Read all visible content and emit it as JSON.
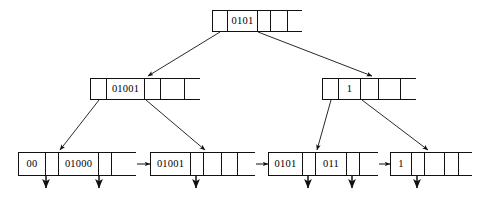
{
  "diagram": {
    "type": "b-plus-tree",
    "stroke_color": "#111111",
    "background_color": "#ffffff",
    "fanout": 5
  },
  "nodes": {
    "root": {
      "name": "root-node",
      "x": 212,
      "y": 10,
      "w": 90,
      "h": 22,
      "cells": [
        {
          "kind": "pointer",
          "label": "",
          "w": 15
        },
        {
          "kind": "key",
          "label": "0101",
          "w": 30
        },
        {
          "kind": "pointer",
          "label": "",
          "w": 13
        },
        {
          "kind": "empty",
          "label": "",
          "w": 17
        },
        {
          "kind": "empty",
          "label": "",
          "w": 15
        }
      ]
    },
    "internal_left": {
      "name": "internal-node-left",
      "x": 90,
      "y": 78,
      "w": 110,
      "h": 22,
      "cells": [
        {
          "kind": "pointer",
          "label": "",
          "w": 16
        },
        {
          "kind": "key",
          "label": "01001",
          "w": 38
        },
        {
          "kind": "pointer",
          "label": "",
          "w": 16
        },
        {
          "kind": "empty",
          "label": "",
          "w": 24
        },
        {
          "kind": "empty",
          "label": "",
          "w": 16
        }
      ]
    },
    "internal_right": {
      "name": "internal-node-right",
      "x": 322,
      "y": 78,
      "w": 94,
      "h": 22,
      "cells": [
        {
          "kind": "pointer",
          "label": "",
          "w": 16
        },
        {
          "kind": "key",
          "label": "1",
          "w": 22
        },
        {
          "kind": "pointer",
          "label": "",
          "w": 18
        },
        {
          "kind": "empty",
          "label": "",
          "w": 22
        },
        {
          "kind": "empty",
          "label": "",
          "w": 16
        }
      ]
    },
    "leaf_1": {
      "name": "leaf-node-1",
      "x": 18,
      "y": 152,
      "w": 118,
      "h": 24,
      "cells": [
        {
          "kind": "key",
          "label": "00",
          "w": 27
        },
        {
          "kind": "pointer",
          "label": "",
          "w": 13
        },
        {
          "kind": "key",
          "label": "01000",
          "w": 40
        },
        {
          "kind": "pointer",
          "label": "",
          "w": 13
        },
        {
          "kind": "next",
          "label": "",
          "w": 25
        }
      ]
    },
    "leaf_2": {
      "name": "leaf-node-2",
      "x": 150,
      "y": 152,
      "w": 105,
      "h": 24,
      "cells": [
        {
          "kind": "key",
          "label": "01001",
          "w": 40
        },
        {
          "kind": "pointer",
          "label": "",
          "w": 13
        },
        {
          "kind": "empty",
          "label": "",
          "w": 18
        },
        {
          "kind": "empty",
          "label": "",
          "w": 16
        },
        {
          "kind": "next",
          "label": "",
          "w": 18
        }
      ]
    },
    "leaf_3": {
      "name": "leaf-node-3",
      "x": 268,
      "y": 152,
      "w": 110,
      "h": 24,
      "cells": [
        {
          "kind": "key",
          "label": "0101",
          "w": 34
        },
        {
          "kind": "pointer",
          "label": "",
          "w": 13
        },
        {
          "kind": "key",
          "label": "011",
          "w": 31
        },
        {
          "kind": "pointer",
          "label": "",
          "w": 13
        },
        {
          "kind": "next",
          "label": "",
          "w": 19
        }
      ]
    },
    "leaf_4": {
      "name": "leaf-node-4",
      "x": 390,
      "y": 152,
      "w": 82,
      "h": 24,
      "cells": [
        {
          "kind": "key",
          "label": "1",
          "w": 21
        },
        {
          "kind": "pointer",
          "label": "",
          "w": 13
        },
        {
          "kind": "empty",
          "label": "",
          "w": 20
        },
        {
          "kind": "empty",
          "label": "",
          "w": 14
        },
        {
          "kind": "empty",
          "label": "",
          "w": 14
        }
      ]
    }
  },
  "edges": [
    {
      "name": "edge-root-to-internal-left",
      "from": [
        220,
        32
      ],
      "to": [
        148,
        76
      ]
    },
    {
      "name": "edge-root-to-internal-right",
      "from": [
        258,
        32
      ],
      "to": [
        372,
        76
      ]
    },
    {
      "name": "edge-internal-left-to-leaf-1",
      "from": [
        99,
        100
      ],
      "to": [
        60,
        150
      ]
    },
    {
      "name": "edge-internal-left-to-leaf-2",
      "from": [
        146,
        100
      ],
      "to": [
        205,
        150
      ]
    },
    {
      "name": "edge-internal-right-to-leaf-3",
      "from": [
        331,
        100
      ],
      "to": [
        317,
        150
      ]
    },
    {
      "name": "edge-internal-right-to-leaf-4",
      "from": [
        362,
        100
      ],
      "to": [
        428,
        150
      ]
    }
  ],
  "record_arrows": [
    {
      "name": "record-arrow-leaf1-a",
      "x": 46,
      "y0": 168,
      "y1": 188
    },
    {
      "name": "record-arrow-leaf1-b",
      "x": 99,
      "y0": 168,
      "y1": 188
    },
    {
      "name": "record-arrow-leaf2-a",
      "x": 196,
      "y0": 168,
      "y1": 188
    },
    {
      "name": "record-arrow-leaf3-a",
      "x": 308,
      "y0": 168,
      "y1": 188
    },
    {
      "name": "record-arrow-leaf3-b",
      "x": 352,
      "y0": 168,
      "y1": 188
    },
    {
      "name": "record-arrow-leaf4-a",
      "x": 417,
      "y0": 168,
      "y1": 188
    }
  ],
  "sibling_links": [
    {
      "name": "sibling-link-leaf1-leaf2",
      "from": [
        136,
        164
      ],
      "to": [
        150,
        164
      ]
    },
    {
      "name": "sibling-link-leaf2-leaf3",
      "from": [
        255,
        164
      ],
      "to": [
        268,
        164
      ]
    },
    {
      "name": "sibling-link-leaf3-leaf4",
      "from": [
        378,
        164
      ],
      "to": [
        390,
        164
      ]
    }
  ],
  "pointer_ticks": [
    {
      "name": "tick-root-p0",
      "x1": 214,
      "y1": 31,
      "x2": 224,
      "y2": 16
    },
    {
      "name": "tick-root-p1",
      "x1": 258,
      "y1": 18,
      "x2": 272,
      "y2": 31
    },
    {
      "name": "tick-internal-left-p0",
      "x1": 92,
      "y1": 99,
      "x2": 101,
      "y2": 82
    },
    {
      "name": "tick-internal-left-p1",
      "x1": 145,
      "y1": 81,
      "x2": 157,
      "y2": 99
    },
    {
      "name": "tick-internal-right-p0",
      "x1": 325,
      "y1": 99,
      "x2": 333,
      "y2": 82
    },
    {
      "name": "tick-internal-right-p1",
      "x1": 361,
      "y1": 81,
      "x2": 374,
      "y2": 99
    }
  ]
}
